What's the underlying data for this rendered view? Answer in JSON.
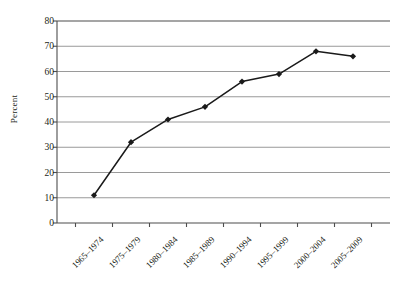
{
  "chart_data": {
    "type": "line",
    "title": "",
    "xlabel": "",
    "ylabel": "Percent",
    "categories": [
      "1965–1974",
      "1975–1979",
      "1980–1984",
      "1985–1989",
      "1990–1994",
      "1995–1999",
      "2000–2004",
      "2005–2009"
    ],
    "values": [
      11,
      32,
      41,
      46,
      56,
      59,
      68,
      66
    ],
    "series": [
      {
        "name": "Percent",
        "values": [
          11,
          32,
          41,
          46,
          56,
          59,
          68,
          66
        ]
      }
    ],
    "ylim": [
      0,
      80
    ],
    "ytick_labels": [
      "0",
      "10",
      "20",
      "30",
      "40",
      "50",
      "60",
      "70",
      "80"
    ],
    "ytick_values": [
      0,
      10,
      20,
      30,
      40,
      50,
      60,
      70,
      80
    ],
    "grid": "horizontal",
    "legend": "none",
    "line_color": "#1a1a1a",
    "marker": "diamond",
    "marker_color": "#1a1a1a",
    "grid_color": "#808080",
    "axis_color": "#4d4d4d",
    "background": "#ffffff"
  }
}
